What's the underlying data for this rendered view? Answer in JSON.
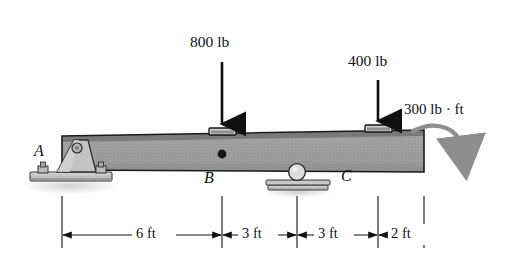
{
  "figure": {
    "type": "beam-free-body-diagram"
  },
  "loads": [
    {
      "name": "load-800",
      "label": "800 lb",
      "value": 800,
      "unit": "lb",
      "direction": "down",
      "x_ft": 6
    },
    {
      "name": "load-400",
      "label": "400 lb",
      "value": 400,
      "unit": "lb",
      "direction": "down",
      "x_ft": 12
    }
  ],
  "moment": {
    "label": "300 lb · ft",
    "value": 300,
    "unit": "lb · ft",
    "sense": "clockwise",
    "x_ft": 14
  },
  "points": [
    {
      "name": "point-A",
      "label": "A",
      "x_ft": 0,
      "support": "pin"
    },
    {
      "name": "point-B",
      "label": "B",
      "x_ft": 6,
      "support": "none"
    },
    {
      "name": "point-C",
      "label": "C",
      "x_ft": 12,
      "support": "none"
    }
  ],
  "supports": [
    {
      "name": "pin-support-A",
      "type": "pin",
      "x_ft": 0
    },
    {
      "name": "roller-support",
      "type": "roller",
      "x_ft": 9
    }
  ],
  "dimensions": [
    {
      "name": "dim-6ft",
      "label": "6 ft",
      "value": 6,
      "unit": "ft"
    },
    {
      "name": "dim-3ft-1",
      "label": "3 ft",
      "value": 3,
      "unit": "ft"
    },
    {
      "name": "dim-3ft-2",
      "label": "3 ft",
      "value": 3,
      "unit": "ft"
    },
    {
      "name": "dim-2ft",
      "label": "2 ft",
      "value": 2,
      "unit": "ft"
    }
  ],
  "beam": {
    "total_length_ft": 14,
    "fill_color": "#9a9a9a",
    "edge_color": "#1a1a1a"
  },
  "colors": {
    "ink": "#111111",
    "beam_gray": "#9a9a9a",
    "beam_dark": "#6f6f6f",
    "moment_gray": "#8e8e8e",
    "support_gray": "#b8b8b8",
    "shadow": "#d9d9d9"
  }
}
